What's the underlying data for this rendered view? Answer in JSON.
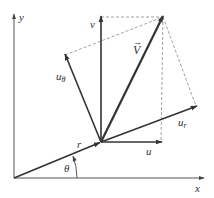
{
  "diagram": {
    "type": "velocity vector decomposition",
    "colors": {
      "axis": "#555555",
      "vector": "#333333",
      "dashed": "#888888",
      "text": "#333333"
    },
    "axes": {
      "x_label": "x",
      "y_label": "y"
    },
    "labels": {
      "r": "r",
      "theta": "θ",
      "v": "v",
      "V": "V",
      "V_arrow": "→",
      "u": "u",
      "u_r_base": "u",
      "u_r_sub": "r",
      "u_theta_base": "u",
      "u_theta_sub": "θ"
    },
    "vectors": [
      {
        "name": "r",
        "from": [
          14,
          178
        ],
        "to": [
          101,
          142
        ]
      },
      {
        "name": "v",
        "from": [
          101,
          142
        ],
        "to": [
          101,
          17
        ]
      },
      {
        "name": "V",
        "from": [
          101,
          142
        ],
        "to": [
          163,
          17
        ]
      },
      {
        "name": "u",
        "from": [
          101,
          142
        ],
        "to": [
          161,
          142
        ]
      },
      {
        "name": "u_r",
        "from": [
          101,
          142
        ],
        "to": [
          196,
          106
        ]
      },
      {
        "name": "u_theta",
        "from": [
          101,
          142
        ],
        "to": [
          65,
          55
        ]
      }
    ]
  }
}
